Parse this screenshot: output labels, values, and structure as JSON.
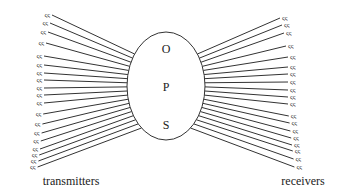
{
  "diagram": {
    "center": {
      "shape": "ellipse",
      "letters": [
        "O",
        "P",
        "S"
      ]
    },
    "left_caption": "transmitters",
    "right_caption": "receivers",
    "node_glyph": "ςς",
    "left_nodes_y": [
      15,
      23,
      32,
      43,
      56,
      65,
      73,
      80,
      88,
      95,
      103,
      114,
      124,
      133,
      141,
      149,
      155,
      161,
      167
    ],
    "right_nodes_y": [
      18,
      25,
      33,
      46,
      57,
      67,
      74,
      82,
      90,
      97,
      104,
      116,
      123,
      131,
      138,
      145,
      151,
      159,
      167
    ],
    "line_color": "#333333"
  }
}
